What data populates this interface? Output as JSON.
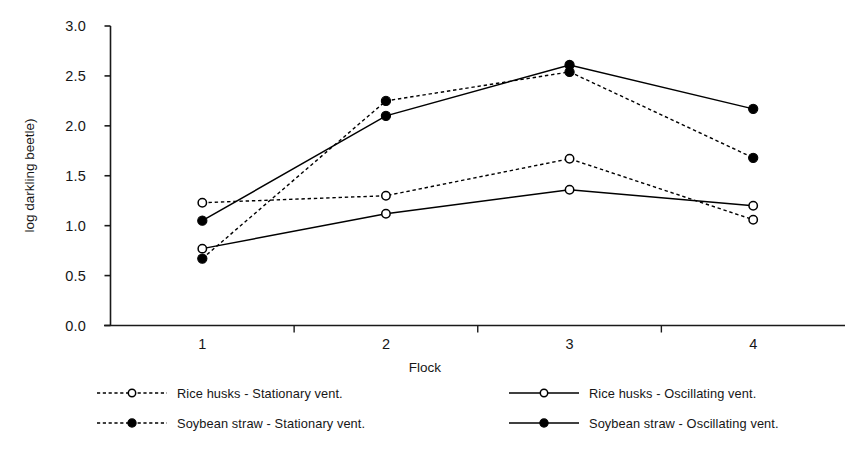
{
  "chart_data": {
    "type": "line",
    "title": "",
    "xlabel": "Flock",
    "ylabel": "log darkling beetle)",
    "categories": [
      "1",
      "2",
      "3",
      "4"
    ],
    "x": [
      1,
      2,
      3,
      4
    ],
    "ylim": [
      0.0,
      3.0
    ],
    "ytick_labels": [
      "0.0",
      "0.5",
      "1.0",
      "1.5",
      "2.0",
      "2.5",
      "3.0"
    ],
    "ytick_values": [
      0.0,
      0.5,
      1.0,
      1.5,
      2.0,
      2.5,
      3.0
    ],
    "xtick_labels": [
      "1",
      "2",
      "3",
      "4"
    ],
    "grid": false,
    "legend_position": "below-plot",
    "series": [
      {
        "name": "Rice husks -  Stationary vent.",
        "values": [
          1.23,
          1.3,
          1.67,
          1.06
        ],
        "line_style": "dashed",
        "marker": "open-circle",
        "color": "#000000"
      },
      {
        "name": "Rice husks -  Oscillating vent.",
        "values": [
          0.77,
          1.12,
          1.36,
          1.2
        ],
        "line_style": "solid",
        "marker": "open-circle",
        "color": "#000000"
      },
      {
        "name": "Soybean straw - Stationary vent.",
        "values": [
          0.67,
          2.25,
          2.54,
          1.68
        ],
        "line_style": "dashed",
        "marker": "filled-circle",
        "color": "#000000"
      },
      {
        "name": "Soybean straw - Oscillating vent.",
        "values": [
          1.05,
          2.1,
          2.61,
          2.17
        ],
        "line_style": "solid",
        "marker": "filled-circle",
        "color": "#000000"
      }
    ]
  },
  "axes": {
    "y_title": "log darkling beetle)",
    "x_title": "Flock",
    "yticks": [
      "0.0",
      "0.5",
      "1.0",
      "1.5",
      "2.0",
      "2.5",
      "3.0"
    ],
    "xticks": [
      "1",
      "2",
      "3",
      "4"
    ]
  },
  "legend": {
    "entries": [
      {
        "label": "Rice husks -  Stationary vent.",
        "line_style": "dashed",
        "marker": "open-circle"
      },
      {
        "label": "Rice husks -  Oscillating vent.",
        "line_style": "solid",
        "marker": "open-circle"
      },
      {
        "label": "Soybean straw - Stationary vent.",
        "line_style": "dashed",
        "marker": "filled-circle"
      },
      {
        "label": "Soybean straw - Oscillating vent.",
        "line_style": "solid",
        "marker": "filled-circle"
      }
    ]
  },
  "colors": {
    "axis": "#1a1a1a",
    "series": "#000000",
    "background": "#ffffff"
  }
}
